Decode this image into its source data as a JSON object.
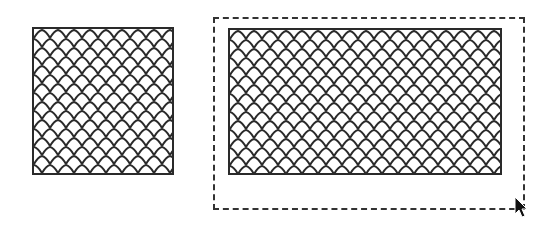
{
  "canvas": {
    "background": "#ffffff"
  },
  "shapes": [
    {
      "id": "left-square",
      "x": 32,
      "y": 27,
      "w": 142,
      "h": 148,
      "fill": "scale-pattern",
      "stroke": "#2a2a2a",
      "selected": false
    },
    {
      "id": "right-rect",
      "x": 228,
      "y": 28,
      "w": 274,
      "h": 147,
      "fill": "scale-pattern",
      "stroke": "#2a2a2a",
      "selected": true
    }
  ],
  "selection_marquee": {
    "x": 213,
    "y": 17,
    "w": 312,
    "h": 193,
    "style": "dashed",
    "color": "#333333"
  },
  "cursor": {
    "icon": "arrow-pointer-icon",
    "x": 514,
    "y": 196
  },
  "pattern": {
    "name": "fish-scale",
    "cell_w": 16,
    "cell_h": 9,
    "line_color": "#2a2a2a",
    "fill_color": "#ffffff"
  }
}
